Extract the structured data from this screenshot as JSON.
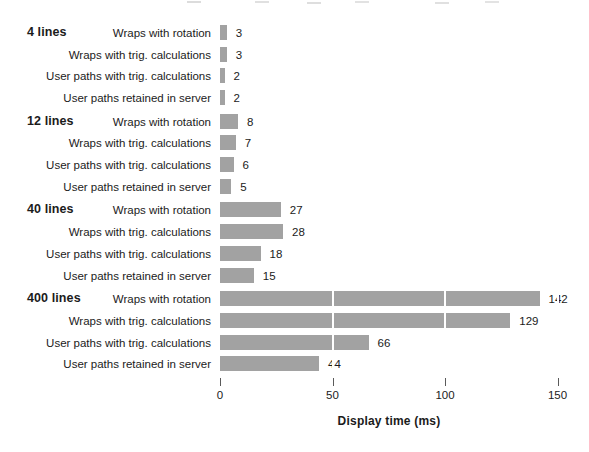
{
  "chart_data": {
    "type": "bar",
    "orientation": "horizontal",
    "title": "",
    "xlabel": "Display time (ms)",
    "ylabel": "",
    "xlim": [
      0,
      150
    ],
    "xticks": [
      0,
      50,
      100,
      150
    ],
    "grid": "white vertical gridlines at tick positions overlaying bars",
    "legend": "none",
    "bar_color": "#a2a2a2",
    "value_labels": "shown at end of each bar",
    "categories": [
      "Wraps with rotation",
      "Wraps with trig. calculations",
      "User paths with trig. calculations",
      "User paths retained in server"
    ],
    "groups": [
      {
        "label": "4 lines",
        "values": [
          3,
          3,
          2,
          2
        ]
      },
      {
        "label": "12 lines",
        "values": [
          8,
          7,
          6,
          5
        ]
      },
      {
        "label": "40 lines",
        "values": [
          27,
          28,
          18,
          15
        ]
      },
      {
        "label": "400 lines",
        "values": [
          142,
          129,
          66,
          44
        ]
      }
    ]
  }
}
